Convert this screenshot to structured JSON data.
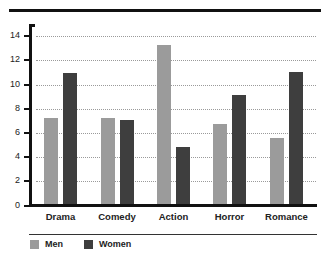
{
  "chart_data": {
    "type": "bar",
    "title": "",
    "xlabel": "",
    "ylabel": "",
    "categories": [
      "Drama",
      "Comedy",
      "Action",
      "Horror",
      "Romance"
    ],
    "series": [
      {
        "name": "Men",
        "color": "#9b9b9b",
        "values": [
          7.3,
          7.3,
          13.3,
          6.8,
          5.6
        ]
      },
      {
        "name": "Women",
        "color": "#3e3e3e",
        "values": [
          11.0,
          7.1,
          4.9,
          9.2,
          11.1
        ]
      }
    ],
    "ylim": [
      0,
      14
    ],
    "yticks": [
      "0",
      "2",
      "4",
      "6",
      "8",
      "10",
      "12",
      "14"
    ],
    "grid": true,
    "legend_position": "bottom"
  },
  "legend": {
    "men": "Men",
    "women": "Women"
  }
}
